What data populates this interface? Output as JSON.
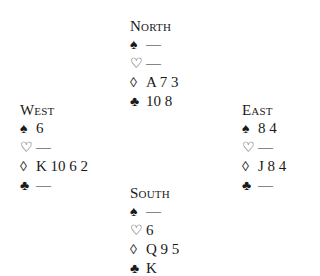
{
  "hands": {
    "north": {
      "name": "North",
      "spades": "—",
      "hearts": "—",
      "diamonds": "A 7 3",
      "clubs": "10 8"
    },
    "west": {
      "name": "West",
      "spades": "6",
      "hearts": "—",
      "diamonds": "K 10 6 2",
      "clubs": "—"
    },
    "east": {
      "name": "East",
      "spades": "8 4",
      "hearts": "—",
      "diamonds": "J 8 4",
      "clubs": "—"
    },
    "south": {
      "name": "South",
      "spades": "—",
      "hearts": "6",
      "diamonds": "Q 9 5",
      "clubs": "K"
    }
  },
  "icons": {
    "spade": "♠",
    "heart": "♡",
    "diamond": "◊",
    "club": "♣"
  }
}
